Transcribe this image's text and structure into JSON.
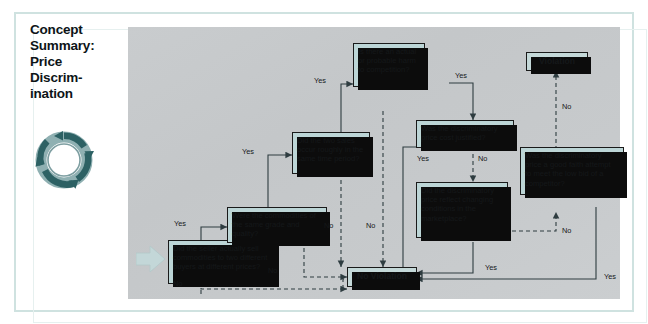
{
  "title": {
    "lines": [
      "Concept",
      "Summary:",
      "Price",
      "Discrim-",
      "ination"
    ],
    "icon": "circular-arrows-icon"
  },
  "colors": {
    "box_fill": "#bcd5d6",
    "terminal_fill": "#c4d8d8",
    "box_border": "#1a1a1a",
    "shadow": "#0c0c0c",
    "canvas": "#c9ccce",
    "frame": "#cfe2e0",
    "icon_teal": "#3c6a6b",
    "text": "#15181a",
    "entry_arrow": "#c3d7d8"
  },
  "flowchart": {
    "type": "decision-flowchart",
    "entry_arrow": "entry-arrow-icon",
    "nodes": [
      {
        "id": "q1",
        "label": "Did the seller actually sell commodities to two different buyers at different prices?"
      },
      {
        "id": "q2",
        "label": "Were the commodities of the same grade and quality?"
      },
      {
        "id": "q3",
        "label": "Did the two sales occur roughly in the same time period?"
      },
      {
        "id": "q4",
        "label": "Is there an actual or probable harm to competition?"
      },
      {
        "id": "q5",
        "label": "Was the discriminatory price cost justified?"
      },
      {
        "id": "q6",
        "label": "Did the discriminatory price reflect changing conditions in the marketplace?"
      },
      {
        "id": "q7",
        "label": "Was the discriminatory price a good faith attempt to meet the low bid of a competitor?"
      },
      {
        "id": "violation",
        "label": "Violation"
      },
      {
        "id": "noviolation",
        "label": "No Violation"
      }
    ],
    "edges": [
      {
        "from": "q1",
        "to": "q2",
        "label": "Yes"
      },
      {
        "from": "q1",
        "to": "noviolation",
        "label": "No"
      },
      {
        "from": "q2",
        "to": "q3",
        "label": "Yes"
      },
      {
        "from": "q2",
        "to": "noviolation",
        "label": "No"
      },
      {
        "from": "q3",
        "to": "q4",
        "label": "Yes"
      },
      {
        "from": "q3",
        "to": "noviolation",
        "label": "No"
      },
      {
        "from": "q4",
        "to": "q5",
        "label": "Yes"
      },
      {
        "from": "q4",
        "to": "noviolation",
        "label": "No"
      },
      {
        "from": "q5",
        "to": "noviolation",
        "label": "Yes"
      },
      {
        "from": "q5",
        "to": "q6",
        "label": "No"
      },
      {
        "from": "q6",
        "to": "noviolation",
        "label": "Yes"
      },
      {
        "from": "q6",
        "to": "q7",
        "label": "No"
      },
      {
        "from": "q7",
        "to": "noviolation",
        "label": "Yes"
      },
      {
        "from": "q7",
        "to": "violation",
        "label": "No"
      }
    ],
    "edge_labels": {
      "q1_yes": "Yes",
      "q1_no": "No",
      "q2_yes": "Yes",
      "q2_no": "No",
      "q3_yes": "Yes",
      "q3_no": "No",
      "q4_yes": "Yes",
      "q4_no": "No",
      "q5_yes": "Yes",
      "q5_no": "No",
      "q6_yes": "Yes",
      "q6_no": "No",
      "q7_yes": "Yes",
      "q7_no": "No"
    }
  }
}
